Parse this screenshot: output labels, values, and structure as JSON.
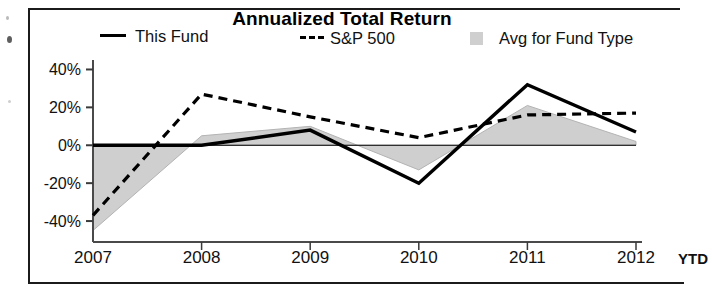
{
  "chart_data": {
    "type": "line",
    "title": "Annualized Total Return",
    "xlabel": "",
    "ylabel": "",
    "x": [
      "2007",
      "2008",
      "2009",
      "2010",
      "2011",
      "2012 YTD"
    ],
    "categories": [
      "2007",
      "2008",
      "2009",
      "2010",
      "2011",
      "2012 YTD"
    ],
    "ylim": [
      -50,
      45
    ],
    "yticks": [
      40,
      20,
      0,
      -20,
      -40
    ],
    "ytick_labels": [
      "40%",
      "20%",
      "0%",
      "-20%",
      "-40%"
    ],
    "grid": false,
    "legend_position": "top",
    "series": [
      {
        "name": "This Fund",
        "style": "solid-line",
        "color": "#000000",
        "values": [
          0,
          0,
          8,
          -20,
          32,
          7
        ]
      },
      {
        "name": "S&P 500",
        "style": "dashed-line",
        "color": "#000000",
        "values": [
          -37,
          27,
          15,
          4,
          16,
          17
        ]
      },
      {
        "name": "Avg for Fund Type",
        "style": "shaded-area",
        "color": "#cfcfcf",
        "values": [
          -45,
          5,
          10,
          -13,
          21,
          2
        ]
      }
    ],
    "annotations": [
      "2012 label is followed by a partially clipped 'YTD'"
    ]
  },
  "title": "Annualized Total Return",
  "legend": [
    {
      "label": "This Fund",
      "marker": "solid-line-swatch"
    },
    {
      "label": "S&P 500",
      "marker": "dashed-line-swatch"
    },
    {
      "label": "Avg for Fund Type",
      "marker": "gray-square-swatch"
    }
  ],
  "axes": {
    "y_tick_labels": [
      "40%",
      "20%",
      "0%",
      "-20%",
      "-40%"
    ],
    "x_tick_labels": [
      "2007",
      "2008",
      "2009",
      "2010",
      "2011",
      "2012"
    ],
    "x_suffix": "YTD"
  }
}
